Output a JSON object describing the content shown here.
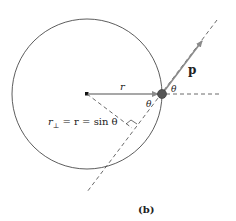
{
  "figure": {
    "caption": "(b)",
    "labels": {
      "r": "r",
      "p": "p",
      "theta_top": "θ",
      "theta_inner": "θ",
      "r_perp_sym": "r",
      "r_perp_sub": "⊥",
      "r_perp_rest": " = r = sin θ"
    },
    "colors": {
      "circle": "#333333",
      "vector": "#8a8a8a",
      "particle": "#555555",
      "dashed": "#444444"
    }
  }
}
